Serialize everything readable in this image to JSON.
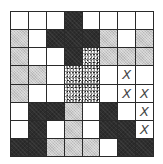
{
  "puzzle": {
    "rows": 8,
    "cols": 8,
    "legend": {
      "W": "white / empty",
      "D": "dark filled",
      "L": "light gray",
      "S": "speckled",
      "X": "crossed-out"
    },
    "colors": {
      "W": "#ffffff",
      "D": "#2e2e2e",
      "L": "#c9c9c9",
      "S": "#8e8e8e",
      "grid": "#2a2a2a",
      "mark": "#444444"
    },
    "mark_glyph": "X",
    "grid": [
      [
        "W",
        "W",
        "W",
        "D",
        "W",
        "W",
        "W",
        "W"
      ],
      [
        "L",
        "W",
        "D",
        "D",
        "D",
        "L",
        "W",
        "L"
      ],
      [
        "L",
        "W",
        "W",
        "D",
        "S",
        "L",
        "L",
        "L"
      ],
      [
        "L",
        "L",
        "W",
        "S",
        "S",
        "W",
        "X",
        "W"
      ],
      [
        "L",
        "W",
        "W",
        "S",
        "S",
        "W",
        "X",
        "X"
      ],
      [
        "W",
        "D",
        "D",
        "L",
        "W",
        "D",
        "W",
        "X"
      ],
      [
        "W",
        "D",
        "W",
        "L",
        "W",
        "D",
        "D",
        "X"
      ],
      [
        "D",
        "D",
        "L",
        "L",
        "L",
        "W",
        "D",
        "D"
      ]
    ]
  }
}
